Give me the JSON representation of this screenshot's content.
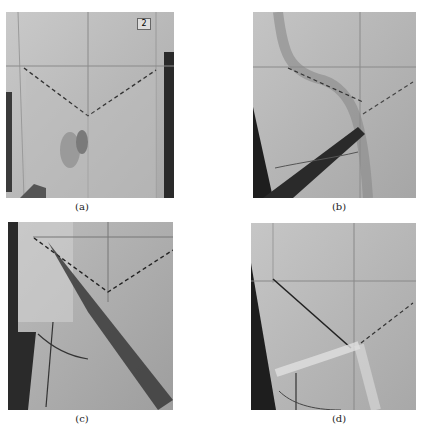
{
  "figure": {
    "panels": [
      {
        "id": "a",
        "caption": "(a)",
        "badge": "2",
        "description": "Dress form front with draped fabric; V-shaped dashed line below bust line, hand pinning fabric"
      },
      {
        "id": "b",
        "caption": "(b)",
        "description": "Fabric folded along dashed line with dark strip crossing diagonally"
      },
      {
        "id": "c",
        "caption": "(c)",
        "description": "Fabric pulled diagonally across the V-shaped dashed line"
      },
      {
        "id": "d",
        "caption": "(d)",
        "description": "Crossed fabric strips forming a knot-like twist at the V point"
      }
    ]
  }
}
